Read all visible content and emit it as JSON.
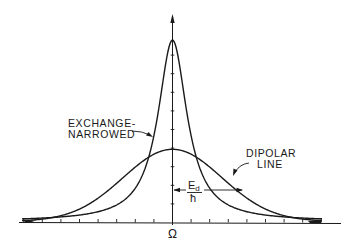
{
  "diagram": {
    "title": "",
    "curves": [
      {
        "id": "exchange-narrowed",
        "label_line1": "EXCHANGE-",
        "label_line2": "NARROWED",
        "shape": "lorentzian",
        "peak_px_height": 183,
        "half_width_px": 17.6
      },
      {
        "id": "dipolar",
        "label_line1": "DIPOLAR",
        "label_line2": "LINE",
        "shape": "gaussian",
        "peak_px_height": 72,
        "sigma_px": 49.4
      }
    ],
    "x_axis": {
      "center_label": "Ω",
      "ticks_each_side": 8
    },
    "y_axis": {
      "ticks": 9
    },
    "width_annotation": {
      "numerator": "E",
      "subscript": "d",
      "denominator": "ħ"
    },
    "colors": {
      "ink": "#1a1a1a",
      "background": "#ffffff"
    }
  }
}
